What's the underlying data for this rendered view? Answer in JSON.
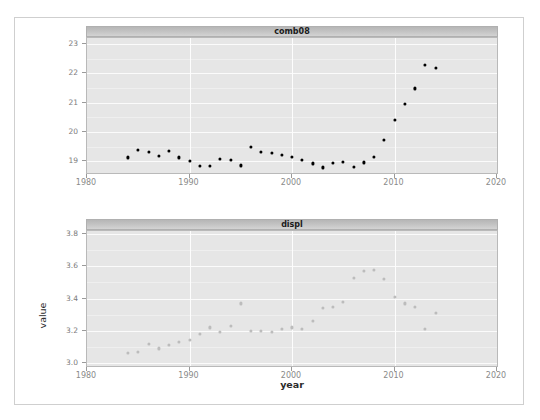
{
  "cutoff_text": "·· ·",
  "axis_label_y": "value",
  "axis_label_x": "year",
  "colors": {
    "panel_background": "#e6e6e6",
    "strip_background": "#c2c2c2",
    "gridline": "#fbfbfb",
    "point_top": "#000000",
    "point_bottom": "#bcbcbc",
    "frame_border": "#cfcfcf"
  },
  "chart_data": [
    {
      "type": "scatter",
      "title": "comb08",
      "xlabel": "year",
      "ylabel": "value",
      "xlim": [
        1980,
        2020
      ],
      "ylim": [
        18.6,
        23.2
      ],
      "grid": true,
      "legend": "none",
      "point_color": "#000000",
      "xticks": [
        1980,
        1990,
        2000,
        2010,
        2020
      ],
      "yticks": [
        19,
        20,
        21,
        22,
        23
      ],
      "series": [
        {
          "name": "comb08",
          "points": [
            {
              "x": 1984,
              "y": 19.13
            },
            {
              "x": 1985,
              "y": 19.39
            },
            {
              "x": 1986,
              "y": 19.32
            },
            {
              "x": 1987,
              "y": 19.18
            },
            {
              "x": 1988,
              "y": 19.36
            },
            {
              "x": 1989,
              "y": 19.13
            },
            {
              "x": 1990,
              "y": 19.01
            },
            {
              "x": 1991,
              "y": 18.83
            },
            {
              "x": 1992,
              "y": 18.85
            },
            {
              "x": 1993,
              "y": 19.08
            },
            {
              "x": 1994,
              "y": 19.06
            },
            {
              "x": 1995,
              "y": 18.86
            },
            {
              "x": 1996,
              "y": 19.5
            },
            {
              "x": 1997,
              "y": 19.33
            },
            {
              "x": 1998,
              "y": 19.29
            },
            {
              "x": 1999,
              "y": 19.21
            },
            {
              "x": 2000,
              "y": 19.14
            },
            {
              "x": 2001,
              "y": 19.04
            },
            {
              "x": 2002,
              "y": 18.93
            },
            {
              "x": 2003,
              "y": 18.79
            },
            {
              "x": 2004,
              "y": 18.95
            },
            {
              "x": 2005,
              "y": 18.98
            },
            {
              "x": 2006,
              "y": 18.8
            },
            {
              "x": 2007,
              "y": 18.96
            },
            {
              "x": 2008,
              "y": 19.15
            },
            {
              "x": 2009,
              "y": 19.72
            },
            {
              "x": 2010,
              "y": 20.42
            },
            {
              "x": 2011,
              "y": 20.95
            },
            {
              "x": 2012,
              "y": 21.48
            },
            {
              "x": 2013,
              "y": 22.27
            },
            {
              "x": 2014,
              "y": 22.18
            }
          ]
        }
      ]
    },
    {
      "type": "scatter",
      "title": "displ",
      "xlabel": "year",
      "ylabel": "value",
      "xlim": [
        1980,
        2020
      ],
      "ylim": [
        2.98,
        3.82
      ],
      "grid": true,
      "legend": "none",
      "point_color": "#bcbcbc",
      "xticks": [
        1980,
        1990,
        2000,
        2010,
        2020
      ],
      "yticks": [
        "3.0",
        "3.2",
        "3.4",
        "3.6",
        "3.8"
      ],
      "series": [
        {
          "name": "displ",
          "points": [
            {
              "x": 1984,
              "y": 3.06
            },
            {
              "x": 1985,
              "y": 3.07
            },
            {
              "x": 1986,
              "y": 3.12
            },
            {
              "x": 1987,
              "y": 3.09
            },
            {
              "x": 1988,
              "y": 3.11
            },
            {
              "x": 1989,
              "y": 3.13
            },
            {
              "x": 1990,
              "y": 3.14
            },
            {
              "x": 1991,
              "y": 3.18
            },
            {
              "x": 1992,
              "y": 3.22
            },
            {
              "x": 1993,
              "y": 3.19
            },
            {
              "x": 1994,
              "y": 3.23
            },
            {
              "x": 1995,
              "y": 3.37
            },
            {
              "x": 1996,
              "y": 3.2
            },
            {
              "x": 1997,
              "y": 3.2
            },
            {
              "x": 1998,
              "y": 3.19
            },
            {
              "x": 1999,
              "y": 3.21
            },
            {
              "x": 2000,
              "y": 3.22
            },
            {
              "x": 2001,
              "y": 3.21
            },
            {
              "x": 2002,
              "y": 3.26
            },
            {
              "x": 2003,
              "y": 3.34
            },
            {
              "x": 2004,
              "y": 3.35
            },
            {
              "x": 2005,
              "y": 3.38
            },
            {
              "x": 2006,
              "y": 3.53
            },
            {
              "x": 2007,
              "y": 3.57
            },
            {
              "x": 2008,
              "y": 3.58
            },
            {
              "x": 2009,
              "y": 3.52
            },
            {
              "x": 2010,
              "y": 3.41
            },
            {
              "x": 2011,
              "y": 3.37
            },
            {
              "x": 2012,
              "y": 3.35
            },
            {
              "x": 2013,
              "y": 3.21
            },
            {
              "x": 2014,
              "y": 3.31
            }
          ]
        }
      ]
    }
  ]
}
